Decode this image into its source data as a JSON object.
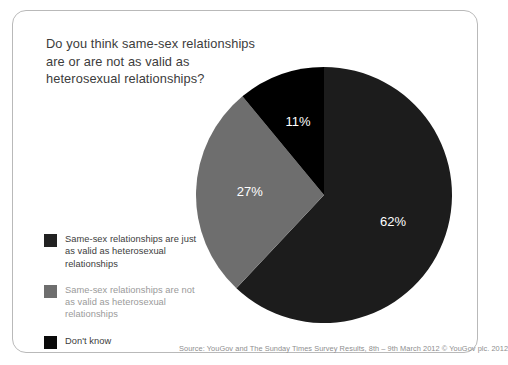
{
  "chart_data": {
    "type": "pie",
    "title": "Do you think same-sex relationships are or are not as valid as heterosexual relationships?",
    "categories": [
      "Same-sex relationships are just as valid as heterosexual relationships",
      "Same-sex relationships are not as valid as heterosexual relationships",
      "Don't know"
    ],
    "values": [
      62,
      27,
      11
    ],
    "labels": [
      "62%",
      "27%",
      "11%"
    ],
    "colors": [
      "#1c1c1c",
      "#6e6e6e",
      "#000000"
    ],
    "label_color": "#ffffff",
    "start_angle_deg": 0,
    "direction": "clockwise",
    "legend_position": "left-bottom",
    "grid": false,
    "xlabel": "",
    "ylabel": ""
  },
  "panel": {
    "title_text": "Do you think same-sex relationships\nare or are not as valid as\nheterosexual relationships?",
    "border_color": "#b9b9b9",
    "background": "#ffffff"
  },
  "legend": {
    "items": [
      {
        "label": "Same-sex relationships are just\nas valid as heterosexual\nrelationships",
        "swatch_color": "#222222",
        "text_color": "#3c3c3c"
      },
      {
        "label": "Same-sex relationships are not\nas valid as heterosexual\nrelationships",
        "swatch_color": "#6e6e6e",
        "text_color": "#9a9a9a"
      },
      {
        "label": "Don't know",
        "swatch_color": "#0a0a0a",
        "text_color": "#3c3c3c"
      }
    ]
  },
  "footer": {
    "source": "Source: YouGov and The Sunday Times Survey Results, 8th – 9th March 2012 © YouGov plc. 2012"
  }
}
